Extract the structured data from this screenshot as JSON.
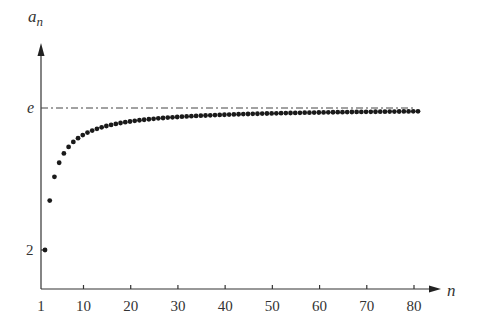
{
  "chart_data": {
    "type": "scatter",
    "title": "",
    "xlabel": "n",
    "ylabel": "a_n",
    "ylabel_main": "a",
    "ylabel_sub": "n",
    "x_ticks": [
      "1",
      "10",
      "20",
      "30",
      "40",
      "50",
      "60",
      "70",
      "80"
    ],
    "x_tick_values": [
      1,
      10,
      20,
      30,
      40,
      50,
      60,
      70,
      80
    ],
    "y_ticks": [
      "2",
      "e"
    ],
    "y_tick_values": [
      2,
      2.71828
    ],
    "asymptote": {
      "label": "e",
      "value": 2.71828,
      "style": "dash-dot"
    },
    "series": [
      {
        "name": "a_n = (1 + 1/n)^n",
        "x_range": [
          1,
          80
        ]
      }
    ],
    "grid": false,
    "legend": "none"
  }
}
